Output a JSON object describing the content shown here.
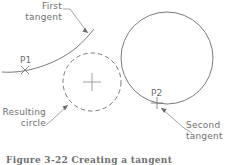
{
  "figure": {
    "caption": "Figure 3-22  Creating a tangent"
  },
  "labels": {
    "first_tangent": {
      "line1": "First",
      "line2": "tangent"
    },
    "resulting_circle": {
      "line1": "Resulting",
      "line2": "circle"
    },
    "second_tangent": {
      "line1": "Second",
      "line2": "tangent"
    }
  },
  "points": {
    "p1": "P1",
    "p2": "P2"
  },
  "colors": {
    "line": "#6b6b6b",
    "text": "#6e6e6e",
    "background": "#ffffff",
    "caption": "#707070"
  },
  "geometry": {
    "resulting_circle": {
      "cx": 92,
      "cy": 82,
      "r": 29,
      "style": "dashed"
    },
    "large_circle": {
      "cx": 167,
      "cy": 58,
      "r": 46,
      "style": "solid"
    },
    "first_tangent_arc": {
      "from_x": 2,
      "from_y": 72,
      "to_x": 94,
      "to_y": 29
    },
    "center_mark": {
      "cx": 92,
      "cy": 82,
      "size": 9
    },
    "p1_marker": {
      "x": 25,
      "y": 70,
      "glyph": "x-mark"
    },
    "p2_marker": {
      "x": 157,
      "y": 103,
      "glyph": "plus-mark"
    }
  }
}
